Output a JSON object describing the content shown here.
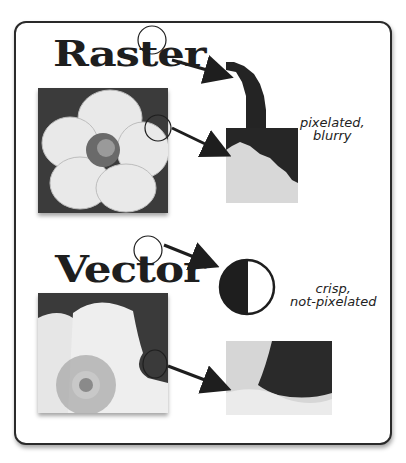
{
  "diagram": {
    "raster": {
      "title": "Raster",
      "caption_line1": "pixelated,",
      "caption_line2": "blurry"
    },
    "vector": {
      "title": "Vector",
      "caption_line1": "crisp,",
      "caption_line2": "not-pixelated"
    },
    "colors": {
      "ink": "#1e1e1e",
      "frame": "#2a2a2a",
      "background": "#ffffff"
    }
  }
}
